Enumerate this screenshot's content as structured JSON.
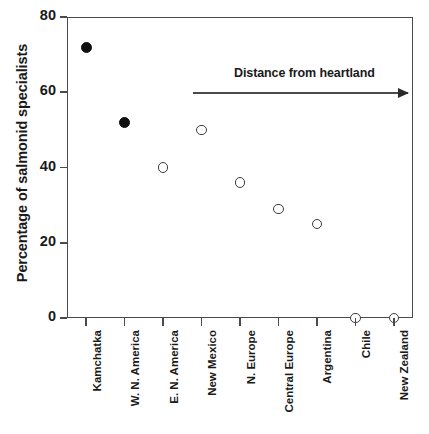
{
  "chart_data": {
    "type": "scatter",
    "title": "",
    "xlabel": "",
    "ylabel": "Percentage of salmonid specialists",
    "ylim": [
      0,
      80
    ],
    "yticks": [
      0,
      20,
      40,
      60,
      80
    ],
    "grid": false,
    "legend": null,
    "categories": [
      "Kamchatka",
      "W. N. America",
      "E. N. America",
      "New Mexico",
      "N. Europe",
      "Central Europe",
      "Argentina",
      "Chile",
      "New Zealand"
    ],
    "values": [
      72,
      52,
      40,
      50,
      36,
      29,
      25,
      0,
      0
    ],
    "marker_styles": [
      "filled",
      "filled",
      "open",
      "open",
      "open",
      "open",
      "open",
      "open",
      "open"
    ],
    "points": [
      {
        "category": "Kamchatka",
        "value": 72,
        "marker": "filled"
      },
      {
        "category": "W. N. America",
        "value": 52,
        "marker": "filled"
      },
      {
        "category": "E. N. America",
        "value": 40,
        "marker": "open"
      },
      {
        "category": "New Mexico",
        "value": 50,
        "marker": "open"
      },
      {
        "category": "N. Europe",
        "value": 36,
        "marker": "open"
      },
      {
        "category": "Central Europe",
        "value": 29,
        "marker": "open"
      },
      {
        "category": "Argentina",
        "value": 25,
        "marker": "open"
      },
      {
        "category": "Chile",
        "value": 0,
        "marker": "open"
      },
      {
        "category": "New Zealand",
        "value": 0,
        "marker": "open"
      }
    ],
    "annotations": [
      {
        "text": "Distance from heartland",
        "type": "arrow-right"
      }
    ],
    "colors": {
      "filled_marker": "#111111",
      "open_marker_stroke": "#3d3d3d",
      "axis": "#4a4a4a",
      "text": "#1a1a1a",
      "background": "#ffffff"
    }
  }
}
